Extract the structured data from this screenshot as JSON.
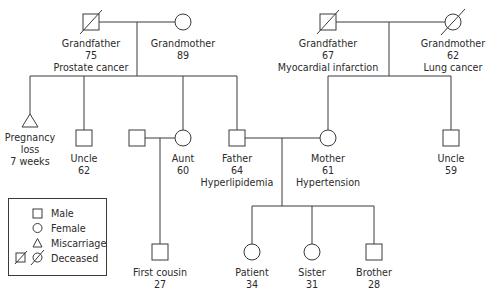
{
  "diagram": {
    "type": "family-pedigree",
    "colors": {
      "line": "#3a3a3a",
      "text": "#2b2b2b",
      "background": "#ffffff"
    },
    "individuals": {
      "pat_grandfather": {
        "label": "Grandfather",
        "age": "75",
        "condition": "Prostate cancer",
        "sex": "male",
        "deceased": true
      },
      "pat_grandmother": {
        "label": "Grandmother",
        "age": "89",
        "sex": "female",
        "deceased": false
      },
      "mat_grandfather": {
        "label": "Grandfather",
        "age": "67",
        "condition": "Myocardial infarction",
        "sex": "male",
        "deceased": true
      },
      "mat_grandmother": {
        "label": "Grandmother",
        "age": "62",
        "condition": "Lung cancer",
        "sex": "female",
        "deceased": true
      },
      "pregnancy_loss": {
        "label_line1": "Pregnancy",
        "label_line2": "loss",
        "label_line3": "7 weeks",
        "sex": "miscarriage"
      },
      "pat_uncle": {
        "label": "Uncle",
        "age": "62",
        "sex": "male"
      },
      "aunt_husband": {
        "sex": "male"
      },
      "aunt": {
        "label": "Aunt",
        "age": "60",
        "sex": "female"
      },
      "father": {
        "label": "Father",
        "age": "64",
        "condition": "Hyperlipidemia",
        "sex": "male"
      },
      "mother": {
        "label": "Mother",
        "age": "61",
        "condition": "Hypertension",
        "sex": "female"
      },
      "mat_uncle": {
        "label": "Uncle",
        "age": "59",
        "sex": "male"
      },
      "first_cousin": {
        "label": "First cousin",
        "age": "27",
        "sex": "male"
      },
      "patient": {
        "label": "Patient",
        "age": "34",
        "sex": "female"
      },
      "sister": {
        "label": "Sister",
        "age": "31",
        "sex": "female"
      },
      "brother": {
        "label": "Brother",
        "age": "28",
        "sex": "male"
      }
    },
    "legend": {
      "items": [
        {
          "symbol": "square",
          "label": "Male"
        },
        {
          "symbol": "circle",
          "label": "Female"
        },
        {
          "symbol": "triangle",
          "label": "Miscarriage"
        },
        {
          "symbol": "struck-square-circle",
          "label": "Deceased"
        }
      ]
    }
  }
}
